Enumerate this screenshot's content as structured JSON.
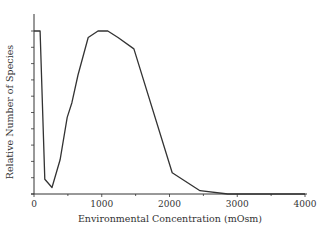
{
  "chart_data": {
    "type": "line",
    "title": "",
    "xlabel": "Environmental Concentration (mOsm)",
    "ylabel": "Relative Number of Species",
    "xlim": [
      0,
      4000
    ],
    "ylim": [
      0,
      1.1
    ],
    "x_ticks": [
      "0",
      "1000",
      "2000",
      "3000",
      "4000"
    ],
    "y_ticks_labeled": false,
    "grid": false,
    "legend": null,
    "series": [
      {
        "name": "species",
        "x": [
          0,
          90,
          160,
          265,
          385,
          490,
          560,
          650,
          800,
          945,
          1090,
          1240,
          1475,
          2040,
          2450,
          2860,
          4000
        ],
        "values": [
          1.0,
          1.0,
          0.09,
          0.04,
          0.21,
          0.47,
          0.56,
          0.73,
          0.96,
          1.0,
          1.0,
          0.96,
          0.89,
          0.13,
          0.02,
          0.0,
          0.0
        ]
      }
    ],
    "line_color": "#333333"
  }
}
